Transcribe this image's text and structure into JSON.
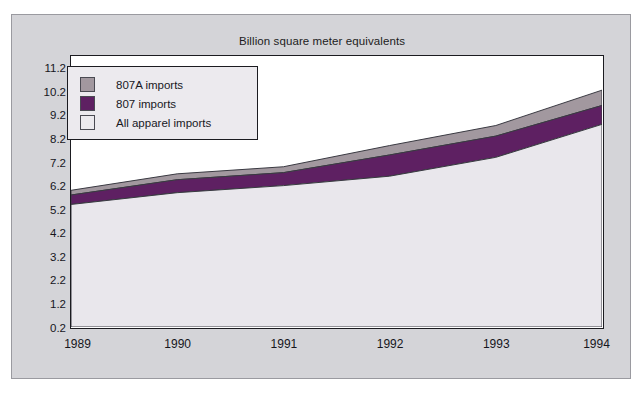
{
  "card": {
    "background": "#d4d4d8",
    "border_color": "#9a9aa0"
  },
  "chart_data": {
    "type": "area",
    "stacked": true,
    "title": "Billion square meter equivalents",
    "xlabel": "",
    "ylabel": "",
    "x": [
      1989,
      1990,
      1991,
      1992,
      1993,
      1994
    ],
    "categories": [
      "1989",
      "1990",
      "1991",
      "1992",
      "1993",
      "1994"
    ],
    "yticks": [
      0.2,
      1.2,
      2.2,
      3.2,
      4.2,
      5.2,
      6.2,
      7.2,
      8.2,
      9.2,
      10.2,
      11.2
    ],
    "ytick_labels": [
      "0.2",
      "1.2",
      "2.2",
      "3.2",
      "4.2",
      "5.2",
      "6.2",
      "7.2",
      "8.2",
      "9.2",
      "10.2",
      "11.2"
    ],
    "ylim": [
      0.2,
      11.7
    ],
    "grid": false,
    "legend_position": "upper-left",
    "series": [
      {
        "name": "All apparel imports",
        "color": "#e9e7ec",
        "values": [
          5.4,
          5.9,
          6.2,
          6.6,
          7.4,
          8.8
        ]
      },
      {
        "name": "807 imports",
        "color": "#5e2062",
        "values": [
          5.8,
          6.45,
          6.75,
          7.5,
          8.3,
          9.6
        ]
      },
      {
        "name": "807A imports",
        "color": "#a2989f",
        "values": [
          6.0,
          6.7,
          7.0,
          7.9,
          8.75,
          10.25
        ]
      }
    ]
  },
  "legend": {
    "items": [
      {
        "label": "807A imports",
        "color": "#a2989f"
      },
      {
        "label": "807 imports",
        "color": "#5e2062"
      },
      {
        "label": "All apparel imports",
        "color": "#eceaee"
      }
    ]
  }
}
